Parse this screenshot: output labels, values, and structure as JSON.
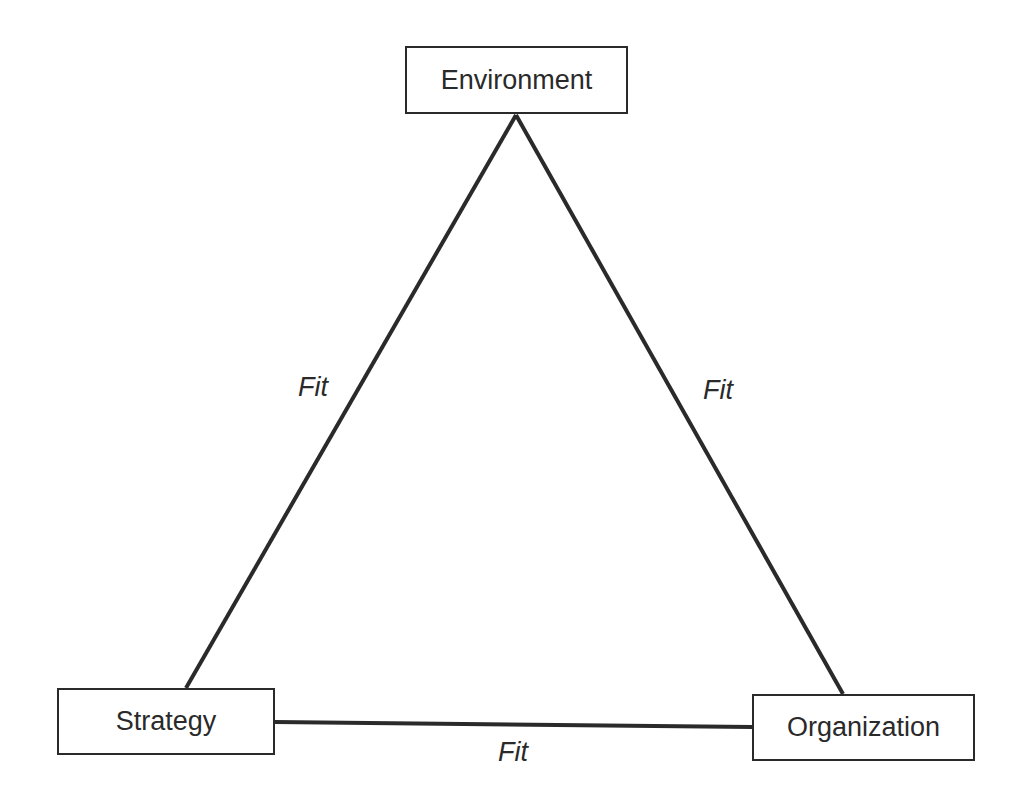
{
  "diagram": {
    "nodes": [
      {
        "id": "environment",
        "label": "Environment"
      },
      {
        "id": "strategy",
        "label": "Strategy"
      },
      {
        "id": "organization",
        "label": "Organization"
      }
    ],
    "edges": [
      {
        "from": "environment",
        "to": "strategy",
        "label": "Fit"
      },
      {
        "from": "environment",
        "to": "organization",
        "label": "Fit"
      },
      {
        "from": "strategy",
        "to": "organization",
        "label": "Fit"
      }
    ],
    "colors": {
      "line": "#2a2a2a",
      "background": "#ffffff"
    }
  }
}
